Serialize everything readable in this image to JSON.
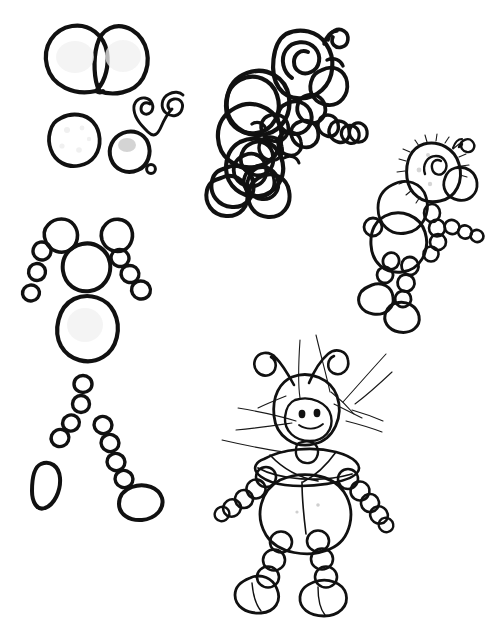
{
  "artwork": {
    "title": "Cartoon ant character construction sheet",
    "medium": "pen-and-ink line drawing",
    "background_color": "#ffffff",
    "ink_color": "#111111",
    "fill_gray_mid": "#b9b9b9",
    "fill_gray_light": "#d9d9d9",
    "fill_gray_pale": "#ededed",
    "fill_white": "#fbfbfb",
    "canvas": {
      "width": 497,
      "height": 619
    }
  },
  "panels": [
    {
      "id": "parts-sheet",
      "name": "exploded-body-parts",
      "label": "Exploded component parts",
      "bounds": {
        "x": 20,
        "y": 18,
        "width": 180,
        "height": 510
      }
    },
    {
      "id": "figure-scribble",
      "name": "rough-scribble-figure",
      "label": "Rough contour scribble figure",
      "bounds": {
        "x": 205,
        "y": 15,
        "width": 145,
        "height": 205
      }
    },
    {
      "id": "figure-shaded",
      "name": "shaded-small-figure",
      "label": "Shaded small figure",
      "bounds": {
        "x": 365,
        "y": 135,
        "width": 125,
        "height": 195
      }
    },
    {
      "id": "figure-final",
      "name": "final-large-figure",
      "label": "Finished large ant figure",
      "bounds": {
        "x": 200,
        "y": 325,
        "width": 200,
        "height": 285
      }
    }
  ],
  "parts": [
    {
      "name": "wing-pair-shape",
      "label": "Wing pair / twin lobes",
      "fill": "#f6f6f6"
    },
    {
      "name": "antennae-spiral-shape",
      "label": "Curled antennae",
      "fill": "none"
    },
    {
      "name": "head-blob-white",
      "label": "Head blob (white)",
      "fill": "#fbfbfb"
    },
    {
      "name": "muzzle-blob-gray",
      "label": "Muzzle blob (gray)",
      "fill": "#b9b9b9"
    },
    {
      "name": "nose-dot",
      "label": "Nose dot",
      "fill": "#b9b9b9"
    },
    {
      "name": "shoulder-left",
      "label": "Left shoulder ball",
      "fill": "#f4f4f4"
    },
    {
      "name": "shoulder-right",
      "label": "Right shoulder ball",
      "fill": "#f4f4f4"
    },
    {
      "name": "thorax-ball",
      "label": "Thorax ball",
      "fill": "#fbfbfb"
    },
    {
      "name": "abdomen-ball",
      "label": "Abdomen ball",
      "fill": "#f4f4f4"
    },
    {
      "name": "arm-segments-left",
      "label": "Left arm segments",
      "count": 3,
      "fill": "#b9b9b9"
    },
    {
      "name": "arm-segments-right",
      "label": "Right arm segments",
      "count": 3,
      "fill": "#b9b9b9"
    },
    {
      "name": "leg-segments-left",
      "label": "Left leg segments",
      "count": 4,
      "fill": "#c6c6c6"
    },
    {
      "name": "leg-segments-right",
      "label": "Right leg segments",
      "count": 5,
      "fill": "#c6c6c6"
    },
    {
      "name": "foot-left",
      "label": "Left foot",
      "fill": "#d9d9d9"
    },
    {
      "name": "foot-right",
      "label": "Right foot",
      "fill": "#d9d9d9"
    }
  ],
  "caption": ""
}
